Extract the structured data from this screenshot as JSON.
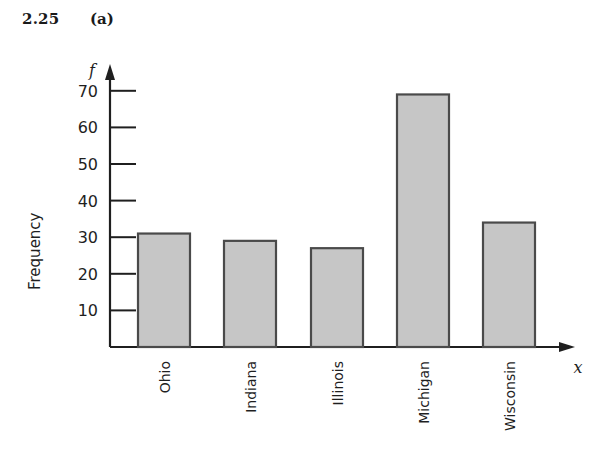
{
  "header": {
    "figure_number": "2.25",
    "part_label": "(a)"
  },
  "chart_data": {
    "type": "bar",
    "title": "",
    "subtitle": "",
    "xlabel": "x",
    "ylabel": "Frequency",
    "y_axis_variable": "f",
    "x_axis_variable": "x",
    "categories": [
      "Ohio",
      "Indiana",
      "Illinois",
      "Michigan",
      "Wisconsin"
    ],
    "values": [
      31,
      29,
      27,
      69,
      34
    ],
    "ylim": [
      0,
      75
    ],
    "y_ticks": [
      10,
      20,
      30,
      40,
      50,
      60,
      70
    ],
    "y_tick_labels": [
      "10",
      "20",
      "30",
      "40",
      "50",
      "60",
      "70"
    ],
    "grid": false,
    "legend": false,
    "bar_fill_color": "#c6c6c6",
    "bar_border_color": "#4a4a4a",
    "axis_color": "#1f1f1f"
  }
}
